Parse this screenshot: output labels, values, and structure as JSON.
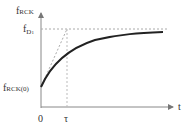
{
  "diagram": {
    "y_axis_label_main": "f",
    "y_axis_label_sub": "RCK",
    "asymptote_label_main": "f",
    "asymptote_label_sub": "D",
    "asymptote_label_subsub": "1",
    "initial_label_main": "f",
    "initial_label_sub": "RCK",
    "initial_label_arg": "(0)",
    "origin_label": "0",
    "tau_label": "τ",
    "x_axis_label": "t",
    "colors": {
      "curve": "#222222",
      "axis": "#888888",
      "dashed": "#aaaaaa",
      "text": "#333333"
    }
  }
}
